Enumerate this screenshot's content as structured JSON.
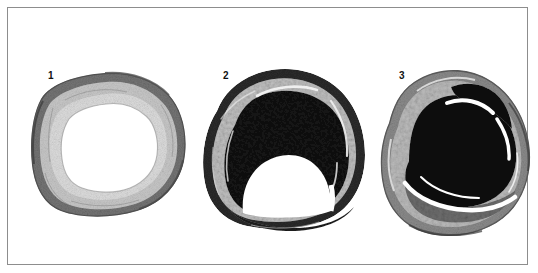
{
  "figure": {
    "kind": "photographic-plate",
    "background_color": "#ffffff",
    "border_color": "#8d8d8d"
  },
  "panels": [
    {
      "label": "1",
      "name": "specimen-1",
      "caption_text": "1",
      "stage": "normal open lumen",
      "label_x": 40,
      "label_y": 65,
      "box": {
        "x": 18,
        "y": 60,
        "w": 172,
        "h": 160
      },
      "colors": {
        "wall_outer": "#6f6f6f",
        "wall_mid": "#b9b9b9",
        "wall_inner": "#d8d8d8",
        "lumen": "#ffffff",
        "plaque": "#ffffff"
      }
    },
    {
      "label": "2",
      "name": "specimen-2",
      "caption_text": "2",
      "stage": "severe plaque, crescent lumen",
      "label_x": 215,
      "label_y": 65,
      "box": {
        "x": 190,
        "y": 58,
        "w": 172,
        "h": 168
      },
      "colors": {
        "wall_outer": "#3a3a3a",
        "wall_mid": "#c9c9c9",
        "wall_inner": "#8a8a8a",
        "lumen": "#ffffff",
        "plaque": "#121212"
      }
    },
    {
      "label": "3",
      "name": "specimen-3",
      "caption_text": "3",
      "stage": "near total occlusion by thrombus",
      "label_x": 390,
      "label_y": 66,
      "box": {
        "x": 368,
        "y": 56,
        "w": 158,
        "h": 172
      },
      "colors": {
        "wall_outer": "#5e5e5e",
        "wall_mid": "#a8a8a8",
        "wall_inner": "#cfcfcf",
        "lumen": "#ffffff",
        "plaque": "#0d0d0d",
        "secondary_mass": "#707070"
      }
    }
  ]
}
